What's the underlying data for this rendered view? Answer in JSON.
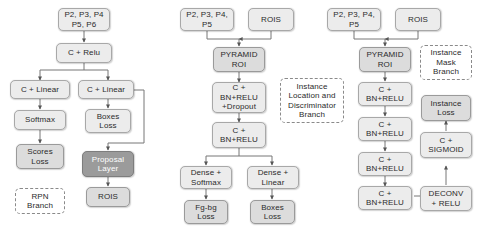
{
  "diagram": {
    "width": 482,
    "height": 236,
    "colors": {
      "background": "#ffffff",
      "node_light": "#ececec",
      "node_mid": "#dcdcdc",
      "node_dark": "#9b9b9b",
      "border": "#a8a8a8",
      "edge": "#555555",
      "text": "#2b2b2b"
    },
    "branches": [
      {
        "id": "rpn",
        "label": "RPN\nBranch"
      },
      {
        "id": "instance-location",
        "label": "Instance\nLocation and\nDiscriminator\nBranch"
      },
      {
        "id": "instance-mask",
        "label": "Instance\nMask\nBranch"
      }
    ],
    "nodes": {
      "l_inputs": "P2, P3, P4\nP5, P6",
      "l_crelu": "C + Relu",
      "l_clinear_left": "C + Linear",
      "l_softmax": "Softmax",
      "l_scores_loss": "Scores\nLoss",
      "l_rpn_branch": "RPN\nBranch",
      "l_clinear_right": "C + Linear",
      "l_boxes_loss": "Boxes\nLoss",
      "l_proposal_layer": "Proposal\nLayer",
      "l_rois": "ROIS",
      "m_inputs": "P2, P3, P4,\nP5",
      "m_rois": "ROIS",
      "m_pyramid_roi": "PYRAMID\nROI",
      "m_c_bn_relu_dropout": "C +\nBN+RELU\n+Dropout",
      "m_c_bn_relu": "C +\nBN+RELU",
      "m_branch_label": "Instance\nLocation and\nDiscriminator\nBranch",
      "m_dense_softmax": "Dense +\nSoftmax",
      "m_dense_linear": "Dense +\nLinear",
      "m_fgbg_loss": "Fg-bg\nLoss",
      "m_boxes_loss": "Boxes\nLoss",
      "r_inputs": "P2, P3, P4,\nP5",
      "r_rois": "ROIS",
      "r_pyramid_roi": "PYRAMID\nROI",
      "r_c_bn_relu_1": "C +\nBN+RELU",
      "r_c_bn_relu_2": "C +\nBN+RELU",
      "r_c_bn_relu_3": "C +\nBN+RELU",
      "r_c_bn_relu_4": "C +\nBN+RELU",
      "r_branch_label": "Instance\nMask\nBranch",
      "r_instance_loss": "Instance\nLoss",
      "r_c_sigmoid": "C +\nSIGMOID",
      "r_deconv_relu": "DECONV\n+ RELU"
    }
  }
}
